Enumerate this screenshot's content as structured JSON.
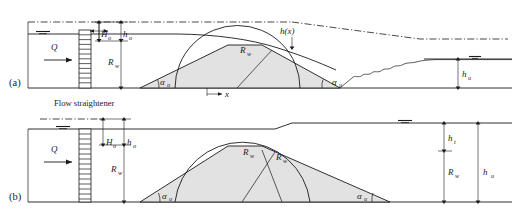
{
  "figure": {
    "panels": [
      {
        "id": "a",
        "label": "(a)",
        "description": "Free overflow with downstream erosion / scour profile",
        "labels": {
          "discharge": "Q",
          "head_upstream": "H",
          "head_upstream_sub": "o",
          "depth_upstream": "h",
          "depth_upstream_sub": "o",
          "weir_radius": "R",
          "weir_radius_sub": "w",
          "crest_radius": "R",
          "crest_radius_sub": "w",
          "flow_depth_profile": "h(x)",
          "angle_upstream": "α",
          "angle_upstream_sub": "o",
          "angle_downstream": "α",
          "angle_downstream_sub": "u",
          "tailwater_depth": "h",
          "tailwater_depth_sub": "u",
          "coordinate_x": "x",
          "flow_straightener": "Flow straightener"
        }
      },
      {
        "id": "b",
        "label": "(b)",
        "description": "Submerged flow with elevated tailwater level",
        "labels": {
          "discharge": "Q",
          "head_upstream": "H",
          "head_upstream_sub": "o",
          "depth_upstream": "h",
          "depth_upstream_sub": "o",
          "weir_radius": "R",
          "weir_radius_sub": "w",
          "crest_radius": "R",
          "crest_radius_sub": "w",
          "angle_upstream": "α",
          "angle_upstream_sub": "o",
          "angle_downstream": "α",
          "angle_downstream_sub": "u",
          "tail_head": "h",
          "tail_head_sub": "t",
          "tail_radius": "R",
          "tail_radius_sub": "w",
          "tailwater_depth": "h",
          "tailwater_depth_sub": "u"
        }
      }
    ],
    "colors": {
      "line": "#1a1a1a",
      "dune_fill": "#e2e2e2",
      "background": "#ffffff"
    }
  }
}
